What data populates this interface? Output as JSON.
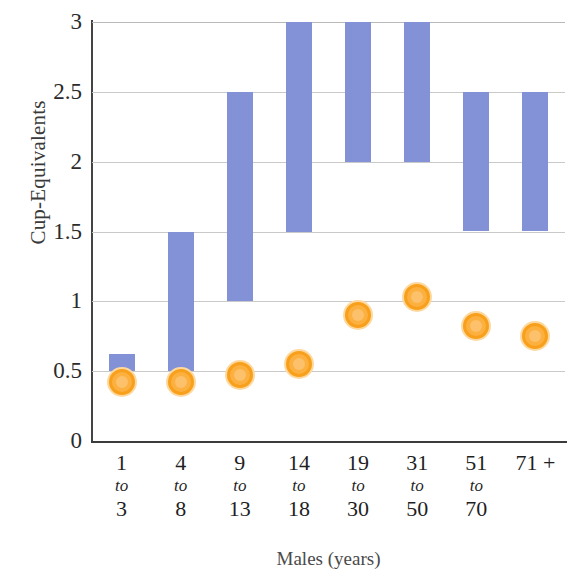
{
  "chart_data": {
    "type": "bar",
    "title": "",
    "xlabel": "Males (years)",
    "ylabel": "Cup-Equivalents",
    "ylim": [
      0,
      3
    ],
    "y_ticks": [
      "3",
      "2.5",
      "2",
      "1.5",
      "1",
      "0.5",
      "0"
    ],
    "y_tick_values": [
      3,
      2.5,
      2,
      1.5,
      1,
      0.5,
      0
    ],
    "grid": true,
    "legend": "none",
    "categories": [
      "1 to 3",
      "4 to 8",
      "9 to 13",
      "14 to 18",
      "19 to 30",
      "31 to 50",
      "51 to 70",
      "71 +"
    ],
    "category_lines": [
      {
        "line_a": "1",
        "line_b": "to",
        "line_c": "3"
      },
      {
        "line_a": "4",
        "line_b": "to",
        "line_c": "8"
      },
      {
        "line_a": "9",
        "line_b": "to",
        "line_c": "13"
      },
      {
        "line_a": "14",
        "line_b": "to",
        "line_c": "18"
      },
      {
        "line_a": "19",
        "line_b": "to",
        "line_c": "30"
      },
      {
        "line_a": "31",
        "line_b": "to",
        "line_c": "50"
      },
      {
        "line_a": "51",
        "line_b": "to",
        "line_c": "70"
      },
      {
        "line_a": "71 +",
        "line_b": "",
        "line_c": ""
      }
    ],
    "series": [
      {
        "name": "Recommended range",
        "type": "range-bar",
        "color": "#8391d7",
        "low": [
          0.5,
          0.5,
          1.0,
          1.5,
          2.0,
          2.0,
          1.5,
          1.5
        ],
        "high": [
          0.62,
          1.5,
          2.5,
          3.0,
          3.0,
          3.0,
          2.5,
          2.5
        ]
      },
      {
        "name": "Average intake",
        "type": "marker",
        "color": "#fbb040",
        "values": [
          0.42,
          0.42,
          0.47,
          0.55,
          0.9,
          1.03,
          0.82,
          0.75
        ]
      }
    ]
  },
  "colors": {
    "bar": "#8391d7",
    "marker_fill": "#fbb040",
    "marker_ring": "#f8a01c",
    "marker_halo": "#fdd9a0",
    "grid": "#c9c9c9",
    "axis": "#3b3b3b",
    "background": "#ffffff"
  }
}
